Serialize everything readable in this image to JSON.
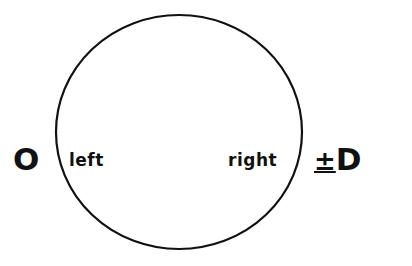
{
  "diagram": {
    "left_endpoint": "O",
    "right_endpoint": "D",
    "right_prefix": "±",
    "inner_left": "left",
    "inner_right": "right"
  }
}
